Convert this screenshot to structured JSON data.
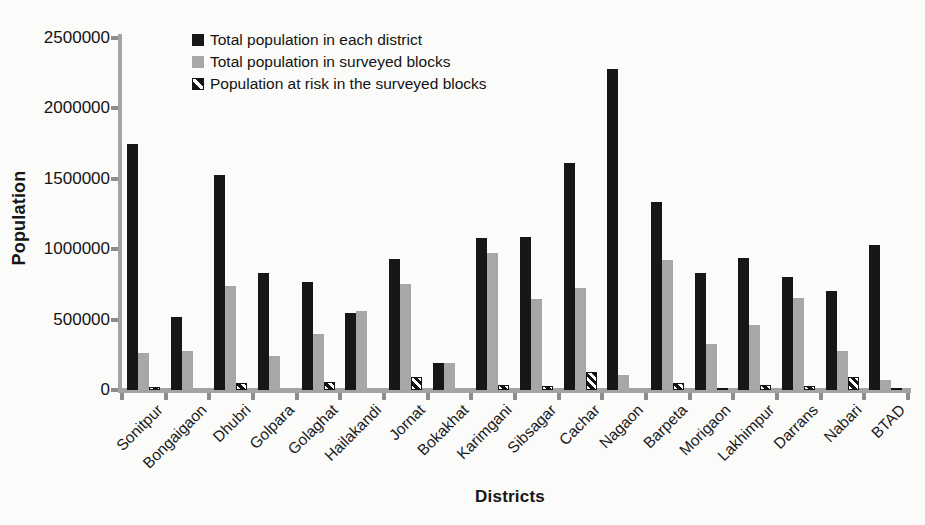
{
  "chart_data": {
    "type": "bar",
    "title": "",
    "xlabel": "Districts",
    "ylabel": "Population",
    "ylim": [
      0,
      2500000
    ],
    "yticks": [
      0,
      500000,
      1000000,
      1500000,
      2000000,
      2500000
    ],
    "grid": false,
    "legend_position": "top-inside",
    "categories": [
      "Sonitpur",
      "Bongaigaon",
      "Dhubri",
      "Golpara",
      "Golaghat",
      "Hailakandi",
      "Jornat",
      "Bokakhat",
      "Karimgani",
      "Sibsagar",
      "Cachar",
      "Nagaon",
      "Barpeta",
      "Morigaon",
      "Lakhimpur",
      "Darrans",
      "Nabari",
      "BTAD"
    ],
    "series": [
      {
        "name": "Total population in each district",
        "style": "solid",
        "color": "#171717",
        "values": [
          1750000,
          520000,
          1530000,
          830000,
          765000,
          550000,
          930000,
          190000,
          1080000,
          1090000,
          1610000,
          2280000,
          1335000,
          830000,
          935000,
          800000,
          700000,
          1030000
        ]
      },
      {
        "name": "Total population in surveyed blocks",
        "style": "solid",
        "color": "#a7a7a7",
        "values": [
          260000,
          280000,
          740000,
          240000,
          400000,
          560000,
          750000,
          190000,
          975000,
          645000,
          725000,
          110000,
          925000,
          330000,
          460000,
          655000,
          275000,
          70000
        ]
      },
      {
        "name": "Population at risk in the surveyed blocks",
        "style": "hatched-diagonal",
        "color": "#141414",
        "values": [
          20000,
          0,
          50000,
          0,
          60000,
          0,
          95000,
          0,
          35000,
          30000,
          125000,
          0,
          50000,
          15000,
          35000,
          30000,
          95000,
          15000
        ]
      }
    ]
  }
}
